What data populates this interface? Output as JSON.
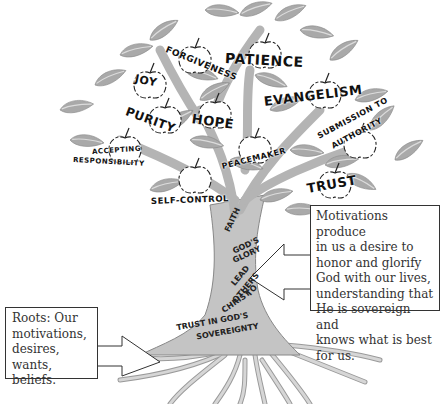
{
  "diagram": {
    "type": "tree-metaphor",
    "fruits": [
      {
        "label": "FORGIVENESS"
      },
      {
        "label": "PATIENCE"
      },
      {
        "label": "JOY"
      },
      {
        "label": "PURITY"
      },
      {
        "label": "HOPE"
      },
      {
        "label": "EVANGELISM"
      },
      {
        "label": "ACCEPTING"
      },
      {
        "label": "RESPONSIBILITY"
      },
      {
        "label": "PEACEMAKER"
      },
      {
        "label": "SUBMISSION TO"
      },
      {
        "label": "AUTHORITY"
      },
      {
        "label": "SELF-CONTROL"
      },
      {
        "label": "TRUST"
      }
    ],
    "trunk": [
      {
        "label": "FAITH"
      },
      {
        "label": "GOD'S"
      },
      {
        "label": "GLORY"
      },
      {
        "label": "LEAD"
      },
      {
        "label": "OTHERS"
      },
      {
        "label": "TO"
      },
      {
        "label": "CHRIST"
      },
      {
        "label": "TRUST IN GOD'S"
      },
      {
        "label": "SOVEREIGNTY"
      }
    ],
    "callouts": {
      "trunk_callout": {
        "lines": [
          "Motivations produce",
          "in us a desire to",
          "honor and glorify",
          "God with our lives,",
          "understanding that",
          "He is sovereign and",
          "knows what is best",
          "for us."
        ]
      },
      "roots_callout": {
        "lines": [
          "Roots: Our",
          "motivations,",
          "desires, wants,",
          "beliefs."
        ]
      }
    },
    "colors": {
      "leaf": "#a9a9a9",
      "leaf_vein": "#d9d9d9",
      "trunk": "#c4c4c4",
      "outline": "#7a7a7a",
      "text": "#111111",
      "callout_border": "#333333"
    }
  }
}
